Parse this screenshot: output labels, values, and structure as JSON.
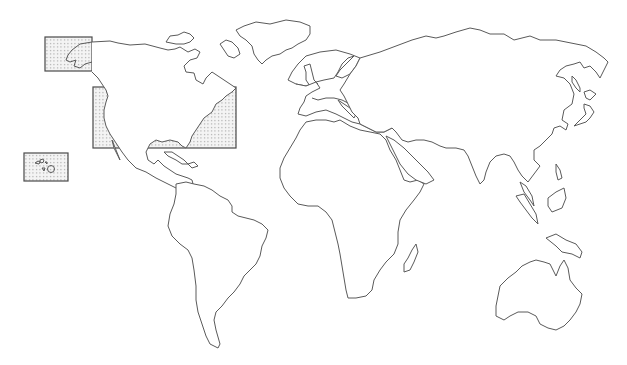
{
  "map": {
    "type": "world-outline-map",
    "width": 627,
    "height": 365,
    "background_color": "#ffffff",
    "outline_color": "#5a5a5a",
    "highlight_fill": "dotted-gray",
    "dot_color": "#8a8a8a",
    "continents": [
      "North America",
      "South America",
      "Europe",
      "Africa",
      "Asia",
      "Australia",
      "Greenland"
    ],
    "highlighted_regions": [
      {
        "id": "alaska",
        "label": "Alaska",
        "box": [
          45,
          37,
          47,
          34
        ]
      },
      {
        "id": "contiguous-us",
        "label": "Contiguous United States",
        "box": [
          93,
          87,
          143,
          61
        ]
      },
      {
        "id": "hawaii",
        "label": "Hawaii",
        "box": [
          24,
          153,
          44,
          28
        ]
      }
    ]
  }
}
